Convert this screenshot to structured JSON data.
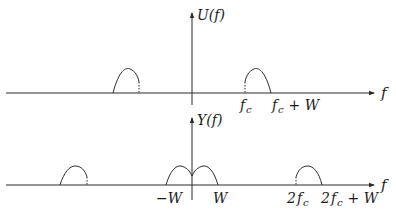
{
  "diagram": {
    "top_plot": {
      "y_label": "U(f)",
      "x_label": "f",
      "tick_labels": [
        {
          "id": "fc",
          "text": "f",
          "sub": "c"
        },
        {
          "id": "fc_plus_W",
          "text": "f",
          "sub": "c",
          "suffix": " + W"
        }
      ],
      "lobes": [
        {
          "name": "negative-band",
          "start": "-f_c - W",
          "end": "-f_c"
        },
        {
          "name": "positive-band",
          "start": "f_c",
          "end": "f_c + W"
        }
      ]
    },
    "bottom_plot": {
      "y_label": "Y(f)",
      "x_label": "f",
      "tick_labels": [
        {
          "id": "minus_W",
          "text": "−W"
        },
        {
          "id": "W",
          "text": "W"
        },
        {
          "id": "2fc",
          "prefix": "2",
          "text": "f",
          "sub": "c"
        },
        {
          "id": "2fc_plus_W",
          "prefix": "2",
          "text": "f",
          "sub": "c",
          "suffix": " + W"
        }
      ],
      "lobes": [
        {
          "name": "negative-2fc-band",
          "start": "-2f_c - W",
          "end": "-2f_c"
        },
        {
          "name": "baseband-left",
          "start": "-W",
          "end": "0"
        },
        {
          "name": "baseband-right",
          "start": "0",
          "end": "W"
        },
        {
          "name": "positive-2fc-band",
          "start": "2f_c",
          "end": "2f_c + W"
        }
      ]
    },
    "colors": {
      "stroke": "#2a2a2a",
      "background": "#ffffff"
    }
  }
}
